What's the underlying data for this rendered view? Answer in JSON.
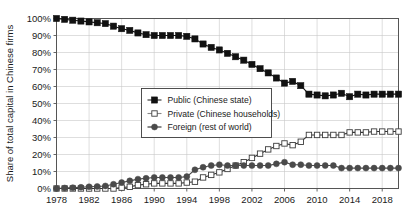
{
  "chart_data": {
    "type": "line",
    "title": "",
    "xlabel": "",
    "ylabel": "Share of total capital in Chinese firms",
    "ylim": [
      0,
      100
    ],
    "xlim": [
      1978,
      2020
    ],
    "grid": true,
    "legend_position": "center-left",
    "ytick_labels": [
      "0%",
      "10%",
      "20%",
      "30%",
      "40%",
      "50%",
      "60%",
      "70%",
      "80%",
      "90%",
      "100%"
    ],
    "ytick_values": [
      0,
      10,
      20,
      30,
      40,
      50,
      60,
      70,
      80,
      90,
      100
    ],
    "xtick_labels": [
      "1978",
      "1982",
      "1986",
      "1990",
      "1994",
      "1998",
      "2002",
      "2006",
      "2010",
      "2014",
      "2018"
    ],
    "xtick_values": [
      1978,
      1982,
      1986,
      1990,
      1994,
      1998,
      2002,
      2006,
      2010,
      2014,
      2018
    ],
    "x": [
      1978,
      1979,
      1980,
      1981,
      1982,
      1983,
      1984,
      1985,
      1986,
      1987,
      1988,
      1989,
      1990,
      1991,
      1992,
      1993,
      1994,
      1995,
      1996,
      1997,
      1998,
      1999,
      2000,
      2001,
      2002,
      2003,
      2004,
      2005,
      2006,
      2007,
      2008,
      2009,
      2010,
      2011,
      2012,
      2013,
      2014,
      2015,
      2016,
      2017,
      2018,
      2019,
      2020
    ],
    "series": [
      {
        "name": "Public (Chinese state)",
        "key": "public",
        "marker": "filled-square",
        "color": "#111111",
        "values": [
          100,
          99.5,
          99,
          98.5,
          98,
          97.5,
          97,
          95.5,
          94,
          93,
          91.5,
          90.5,
          90,
          90,
          90,
          90,
          89.5,
          88,
          85,
          83,
          81.5,
          79.5,
          77.5,
          75.5,
          73,
          70.5,
          68,
          65,
          62,
          63,
          60.5,
          55.5,
          55,
          54.5,
          55,
          56,
          54,
          55.5,
          55,
          55.5,
          55.5,
          55.5,
          55.5
        ]
      },
      {
        "name": "Private (Chinese households)",
        "key": "private",
        "marker": "open-square",
        "color": "#333333",
        "values": [
          0,
          0,
          0,
          0,
          0,
          0,
          0,
          0,
          0.5,
          1,
          2,
          2.5,
          3,
          3,
          3,
          3,
          3.5,
          4,
          6.5,
          8,
          9.5,
          11.5,
          13.5,
          15.5,
          18,
          20.5,
          23,
          25,
          26.5,
          25.5,
          27.5,
          31.5,
          31.5,
          31.5,
          31.5,
          31.5,
          33,
          33,
          33,
          33.5,
          33.5,
          33.5,
          33.5
        ]
      },
      {
        "name": "Foreign (rest of world)",
        "key": "foreign",
        "marker": "filled-circle",
        "color": "#4a4a4a",
        "values": [
          0,
          0.3,
          0.5,
          0.7,
          1,
          1.2,
          1.5,
          2.5,
          3.5,
          4.5,
          5.5,
          6,
          6.5,
          6.5,
          6.5,
          6.5,
          7,
          11,
          12.5,
          13.5,
          14,
          13.5,
          13.5,
          13.5,
          13.5,
          13.5,
          13.5,
          14.5,
          15.5,
          14,
          14,
          13.5,
          13.5,
          13.5,
          13.5,
          12,
          12,
          12,
          12,
          12,
          12,
          12,
          12
        ]
      }
    ],
    "legend": [
      {
        "label": "Public (Chinese state)",
        "marker": "filled-square"
      },
      {
        "label": "Private (Chinese households)",
        "marker": "open-square"
      },
      {
        "label": "Foreign (rest of world)",
        "marker": "filled-circle"
      }
    ]
  }
}
